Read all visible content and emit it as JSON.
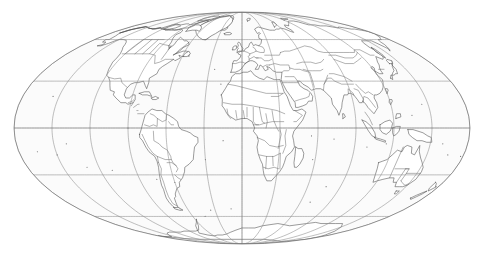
{
  "map": {
    "title": "World Map",
    "projection_name": "Mollweide",
    "projection_type": "equal-area pseudocylindrical",
    "center_longitude": 0,
    "center_latitude": 0,
    "background_color": "#ffffff",
    "land_fill_color": "#ffffff",
    "ocean_fill_color": "#fbfbfb",
    "coastline_color": "#4a4a4a",
    "border_color": "#555555",
    "graticule_color": "#8a8a8a",
    "outline_color": "#6e6e6e",
    "shows_country_borders": true,
    "shows_graticule": true,
    "shows_labels": false,
    "ellipse": {
      "center_x": 242,
      "center_y": 128,
      "semi_axis_x": 228,
      "semi_axis_y": 116
    },
    "graticule": {
      "meridian_interval_degrees": 30,
      "parallel_interval_degrees": 30,
      "meridians_degrees": [
        -180,
        -150,
        -120,
        -90,
        -60,
        -30,
        0,
        30,
        60,
        90,
        120,
        150,
        180
      ],
      "parallels_degrees": [
        -60,
        -30,
        0,
        30,
        60
      ],
      "equator_degrees": 0,
      "prime_meridian_degrees": 0
    },
    "continents": [
      "North America",
      "South America",
      "Europe",
      "Africa",
      "Asia",
      "Australia",
      "Antarctica"
    ]
  },
  "chart_data": {
    "type": "map",
    "projection": "Mollweide",
    "xlabel": "Longitude",
    "ylabel": "Latitude",
    "xlim": [
      -180,
      180
    ],
    "ylim": [
      -90,
      90
    ],
    "grid": true,
    "legend": "none"
  }
}
